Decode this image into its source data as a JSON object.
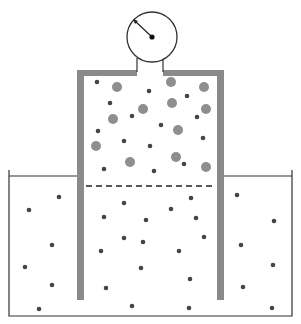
{
  "diagram": {
    "colors": {
      "wall": "#8a8a8a",
      "outline": "#333333",
      "gas_particle": "#8e8e8e",
      "solute_particle": "#454545",
      "background": "#ffffff"
    },
    "gauge": {
      "cx": 152,
      "cy": 37,
      "r": 25,
      "needle_tip": [
        134,
        20
      ]
    },
    "gas_particles": [
      [
        117,
        87
      ],
      [
        171,
        82
      ],
      [
        204,
        87
      ],
      [
        143,
        109
      ],
      [
        172,
        103
      ],
      [
        206,
        109
      ],
      [
        113,
        119
      ],
      [
        178,
        130
      ],
      [
        96,
        146
      ],
      [
        130,
        162
      ],
      [
        176,
        157
      ],
      [
        206,
        167
      ]
    ],
    "vessel_gas_dots": [
      [
        97,
        82
      ],
      [
        149,
        91
      ],
      [
        110,
        103
      ],
      [
        187,
        96
      ],
      [
        132,
        116
      ],
      [
        197,
        117
      ],
      [
        161,
        125
      ],
      [
        98,
        131
      ],
      [
        124,
        141
      ],
      [
        203,
        138
      ],
      [
        150,
        146
      ],
      [
        104,
        169
      ],
      [
        154,
        171
      ],
      [
        184,
        164
      ]
    ],
    "inner_liquid_dots": [
      [
        124,
        203
      ],
      [
        191,
        198
      ],
      [
        104,
        217
      ],
      [
        171,
        209
      ],
      [
        146,
        220
      ],
      [
        196,
        218
      ],
      [
        124,
        238
      ],
      [
        143,
        242
      ],
      [
        204,
        237
      ],
      [
        101,
        251
      ],
      [
        179,
        251
      ],
      [
        141,
        268
      ],
      [
        190,
        279
      ],
      [
        106,
        288
      ],
      [
        132,
        306
      ],
      [
        189,
        308
      ]
    ],
    "outer_liquid_dots": [
      [
        59,
        197
      ],
      [
        29,
        210
      ],
      [
        52,
        245
      ],
      [
        25,
        267
      ],
      [
        52,
        285
      ],
      [
        39,
        309
      ],
      [
        237,
        195
      ],
      [
        274,
        221
      ],
      [
        241,
        245
      ],
      [
        273,
        265
      ],
      [
        243,
        287
      ],
      [
        272,
        308
      ]
    ]
  }
}
